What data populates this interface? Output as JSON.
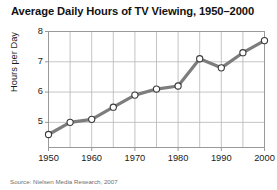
{
  "chart_data": {
    "type": "line",
    "title": "Average Daily Hours of TV Viewing, 1950–2000",
    "xlabel": "",
    "ylabel": "Hours per Day",
    "x": [
      1950,
      1955,
      1960,
      1965,
      1970,
      1975,
      1980,
      1985,
      1990,
      1995,
      2000
    ],
    "values": [
      4.6,
      5.0,
      5.1,
      5.5,
      5.9,
      6.1,
      6.2,
      7.1,
      6.8,
      7.3,
      7.7
    ],
    "xlim": [
      1950,
      2000
    ],
    "ylim": [
      4.17,
      8.0
    ],
    "xticks": [
      1950,
      1960,
      1970,
      1980,
      1990,
      2000
    ],
    "xticklabels": [
      "1950",
      "1960",
      "1970",
      "1980",
      "1990",
      "2000"
    ],
    "x_minor_ticks": [
      1955,
      1965,
      1975,
      1985,
      1995
    ],
    "yticks": [
      5,
      6,
      7,
      8
    ],
    "yticklabels": [
      "5",
      "6",
      "7",
      "8"
    ],
    "grid": true,
    "legend": null,
    "series_name": "Average daily hours of TV viewing",
    "line_color": "#7d7d7d",
    "marker_face_color": "#ffffff",
    "marker_edge_color": "#3a3a3a",
    "grid_color": "#b5b5b5",
    "axis_color": "#9a9a9a"
  },
  "source": {
    "note": "Source: Nielsen Media Research, 2007"
  }
}
